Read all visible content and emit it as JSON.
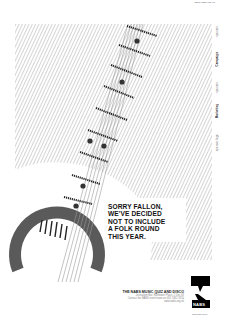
{
  "header": {
    "url": "www.nabs.org.uk"
  },
  "headline": {
    "lines": [
      "SORRY FALLON,",
      "WE'VE DECIDED",
      "NOT TO INCLUDE",
      "A FOLK ROUND",
      "THIS YEAR."
    ]
  },
  "event": {
    "title": "THE NABS MUSIC QUIZ AND DISCO",
    "details": [
      "Jerusalem Bar, Rathbone Place, 2 Dec 09",
      "Contact the NABS event team on 020 7462 3150",
      "www.nabs.org.uk"
    ]
  },
  "sponsors": [
    {
      "label": "sponsor",
      "bold": false
    },
    {
      "label": "Campaign",
      "bold": true
    },
    {
      "label": "sponsor",
      "bold": false
    },
    {
      "label": "Marketing",
      "bold": true
    },
    {
      "label": "sponsor logo",
      "bold": false
    }
  ],
  "logo": {
    "label": "NABS",
    "url": "www.nabs.org.uk"
  },
  "colors": {
    "hatch": "#c8c8c8",
    "guitar_body": "#555555",
    "fret": "#222222",
    "ink": "#111111",
    "logo_black": "#000000"
  },
  "icons": {
    "guitar": "guitar-illustration",
    "speech_bubble": "speech-bubble-icon"
  }
}
